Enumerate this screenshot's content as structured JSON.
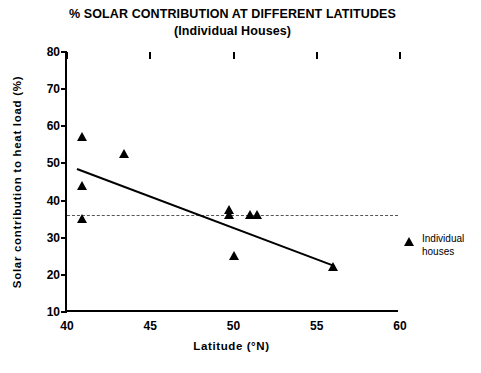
{
  "chart_data": {
    "type": "scatter",
    "title": "% SOLAR CONTRIBUTION AT DIFFERENT LATITUDES",
    "subtitle": "(Individual Houses)",
    "xlabel": "Latitude  (°N)",
    "ylabel": "Solar contribution  to heat load  (%)",
    "xlim": [
      40,
      60
    ],
    "ylim": [
      10,
      80
    ],
    "xticks": [
      "40",
      "45",
      "50",
      "55",
      "60"
    ],
    "yticks": [
      "80",
      "70",
      "60",
      "50",
      "40",
      "30",
      "20",
      "10"
    ],
    "xtick_values": [
      40,
      45,
      50,
      55,
      60
    ],
    "ytick_values": [
      80,
      70,
      60,
      50,
      40,
      30,
      20,
      10
    ],
    "grid": false,
    "legend_position": "right",
    "series": [
      {
        "name": "Individual houses",
        "marker": "triangle-up",
        "color": "#000000",
        "points": [
          {
            "x": 40.9,
            "y": 57.0
          },
          {
            "x": 40.9,
            "y": 44.0
          },
          {
            "x": 40.9,
            "y": 35.0
          },
          {
            "x": 43.4,
            "y": 52.5
          },
          {
            "x": 49.7,
            "y": 37.5
          },
          {
            "x": 49.7,
            "y": 36.0
          },
          {
            "x": 50.0,
            "y": 25.0
          },
          {
            "x": 51.0,
            "y": 36.0
          },
          {
            "x": 51.4,
            "y": 36.0
          },
          {
            "x": 56.0,
            "y": 22.0
          }
        ]
      }
    ],
    "trend_line": {
      "label": "regression-trend-line",
      "style": "solid",
      "color": "#000000",
      "x1": 40.6,
      "y1": 48.5,
      "x2": 56.0,
      "y2": 22.5
    },
    "threshold_line": {
      "label": "mean-reference-line",
      "style": "dashed",
      "color": "#555555",
      "y": 36.2
    }
  },
  "legend": {
    "entries": [
      {
        "marker": "triangle-icon",
        "line1": "Individual",
        "line2": "houses"
      }
    ]
  }
}
